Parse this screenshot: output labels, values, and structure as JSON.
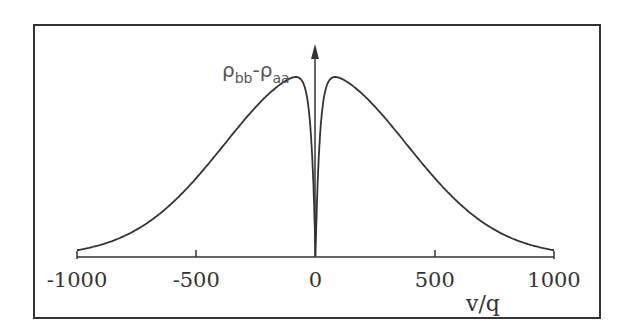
{
  "chart_data": {
    "type": "line",
    "title": "",
    "xlabel": "v/q",
    "ylabel": "ρbb-ρaa",
    "ylabel_main": "ρ",
    "ylabel_sub1": "bb",
    "ylabel_dash": "-ρ",
    "ylabel_sub2": "aa",
    "xlim": [
      -1000,
      1000
    ],
    "xticks": [
      -1000,
      -500,
      0,
      500,
      1000
    ],
    "xtick_labels": [
      "-1000",
      "-500",
      "0",
      "500",
      "1000"
    ],
    "grid": false,
    "legend": null,
    "series": [
      {
        "name": "ρbb-ρaa",
        "x": [
          -1000,
          -900,
          -800,
          -700,
          -600,
          -500,
          -400,
          -300,
          -200,
          -100,
          -60,
          -30,
          -15,
          0,
          15,
          30,
          60,
          100,
          200,
          300,
          400,
          500,
          600,
          700,
          800,
          900,
          1000
        ],
        "y": [
          0.02,
          0.05,
          0.1,
          0.18,
          0.3,
          0.45,
          0.62,
          0.78,
          0.91,
          0.98,
          1.0,
          0.85,
          0.55,
          0.0,
          0.55,
          0.85,
          1.0,
          0.98,
          0.91,
          0.78,
          0.62,
          0.45,
          0.3,
          0.18,
          0.1,
          0.05,
          0.02
        ]
      }
    ]
  }
}
